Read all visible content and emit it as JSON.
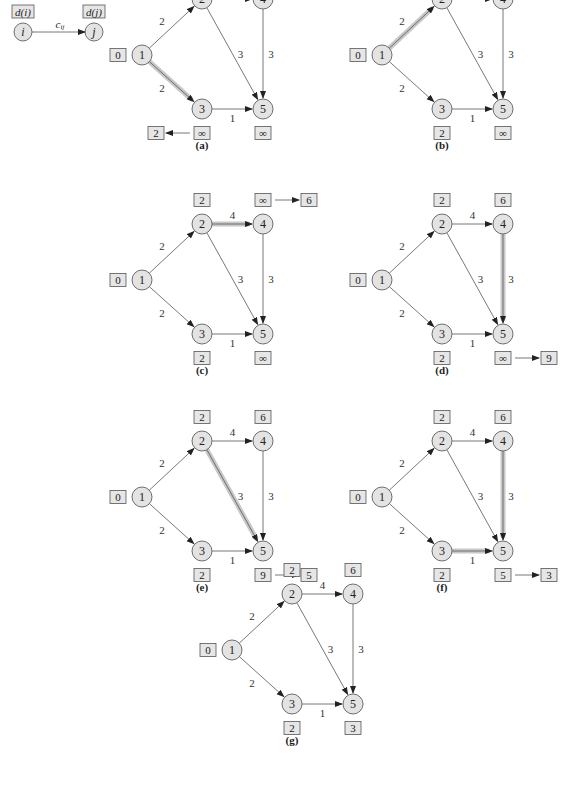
{
  "legend": {
    "from_label": "d(i)",
    "to_label": "d(j)",
    "from_node": "i",
    "to_node": "j",
    "edge_label": "c_ij"
  },
  "graph": {
    "nodes": [
      "1",
      "2",
      "3",
      "4",
      "5"
    ],
    "edges": [
      {
        "from": "1",
        "to": "2",
        "cost": "2"
      },
      {
        "from": "1",
        "to": "3",
        "cost": "2"
      },
      {
        "from": "2",
        "to": "4",
        "cost": "4"
      },
      {
        "from": "2",
        "to": "5",
        "cost": "3"
      },
      {
        "from": "3",
        "to": "5",
        "cost": "1"
      },
      {
        "from": "4",
        "to": "5",
        "cost": "3"
      }
    ]
  },
  "panels": [
    {
      "caption": "(a)",
      "dist": {
        "1": "0",
        "2": "∞",
        "3": "∞",
        "4": "∞",
        "5": "∞"
      },
      "highlight": [
        "1-3"
      ],
      "update": {
        "node": "3",
        "from": "∞",
        "to": "2"
      }
    },
    {
      "caption": "(b)",
      "dist": {
        "1": "0",
        "2": "∞",
        "3": "2",
        "4": "∞",
        "5": "∞"
      },
      "highlight": [
        "1-2"
      ],
      "update": {
        "node": "2",
        "from": "∞",
        "to": "2"
      }
    },
    {
      "caption": "(c)",
      "dist": {
        "1": "0",
        "2": "2",
        "3": "2",
        "4": "∞",
        "5": "∞"
      },
      "highlight": [
        "2-4"
      ],
      "update": {
        "node": "4",
        "from": "∞",
        "to": "6"
      }
    },
    {
      "caption": "(d)",
      "dist": {
        "1": "0",
        "2": "2",
        "3": "2",
        "4": "6",
        "5": "∞"
      },
      "highlight": [
        "4-5"
      ],
      "update": {
        "node": "5",
        "from": "∞",
        "to": "9"
      }
    },
    {
      "caption": "(e)",
      "dist": {
        "1": "0",
        "2": "2",
        "3": "2",
        "4": "6",
        "5": "9"
      },
      "highlight": [
        "2-5"
      ],
      "update": {
        "node": "5",
        "from": "9",
        "to": "5"
      }
    },
    {
      "caption": "(f)",
      "dist": {
        "1": "0",
        "2": "2",
        "3": "2",
        "4": "6",
        "5": "5"
      },
      "highlight": [
        "4-5",
        "3-5"
      ],
      "update": {
        "node": "5",
        "from": "5",
        "to": "3"
      }
    },
    {
      "caption": "(g)",
      "dist": {
        "1": "0",
        "2": "2",
        "3": "2",
        "4": "6",
        "5": "3"
      },
      "highlight": [],
      "update": null
    }
  ],
  "colors": {
    "node_fill": "#e3e3e3",
    "box_fill": "#e6e6e6",
    "highlight": "#c8c8c8",
    "stroke": "#555555"
  }
}
